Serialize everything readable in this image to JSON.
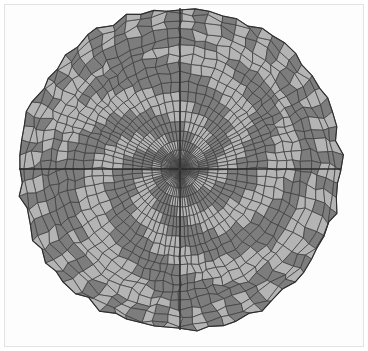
{
  "figure": {
    "type": "polar-mesh-plot",
    "title": "",
    "background_color": "#ffffff",
    "panel_color": "#fdfdfd",
    "frame_color": "#e3e3e3",
    "frame": {
      "x": 4,
      "y": 4,
      "width": 360,
      "height": 343,
      "stroke_width": 1
    }
  },
  "chart_data": {
    "type": "heatmap",
    "title": "",
    "subtitle": "",
    "xlabel": "",
    "ylabel": "",
    "grid": true,
    "legend_position": "none",
    "projection": "polar",
    "center": {
      "x": 180,
      "y": 169
    },
    "radius": 161,
    "radial_rings": 18,
    "angular_sectors": 72,
    "inner_radius_fraction": 0.012,
    "mesh_line_color": "#3d3d3d",
    "mesh_line_width": 0.75,
    "outline_color": "#2e2e2e",
    "outline_width": 1.1,
    "palette": {
      "light": "#b4b4b4",
      "dark": "#7d7d7d"
    },
    "values_legend": [
      {
        "label": "low",
        "color": "#7d7d7d"
      },
      {
        "label": "high",
        "color": "#b4b4b4"
      }
    ],
    "spiral": {
      "arms": 5,
      "twist_turns": 0.62,
      "arm_width_fraction": 0.46,
      "direction": "counterclockwise"
    },
    "mesh_jitter": {
      "radial_amplitude": 0.016,
      "angular_amplitude": 0.22,
      "seed": 20240517
    },
    "ring_radius_profile": [
      0.0,
      0.052,
      0.108,
      0.166,
      0.226,
      0.288,
      0.351,
      0.414,
      0.476,
      0.537,
      0.596,
      0.652,
      0.706,
      0.757,
      0.806,
      0.861,
      0.915,
      0.962,
      1.0
    ],
    "emphasis_axes": {
      "enabled": true,
      "angles_deg": [
        0,
        90,
        180,
        270
      ],
      "color": "#2a2a2a",
      "width": 1.4
    }
  },
  "caption": ""
}
